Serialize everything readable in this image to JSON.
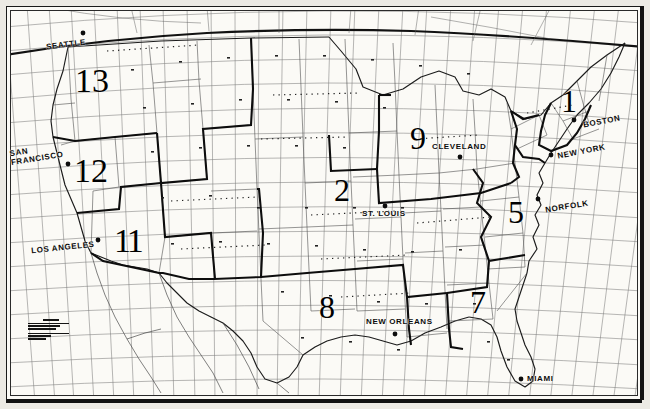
{
  "map": {
    "title": "United States zone map",
    "description": "Scanned black-and-white map of the continental United States showing a latitude/longitude graticule, state outlines and heavy numbered zone boundaries.",
    "colors": {
      "ink": "#111111",
      "paper": "#fbfaf6",
      "page": "#eceae4",
      "grid": "#6e6e6e",
      "state_line": "#4a4a4a",
      "zone_line": "#0d0d0d"
    },
    "grid": {
      "visible": true,
      "style": "graticule",
      "meridian_count": 30,
      "parallel_count": 18
    },
    "cities": [
      {
        "name": "SEATTLE",
        "x": 46,
        "y": 43,
        "dot_x": 83,
        "dot_y": 33,
        "lines": [
          "SEATTLE"
        ]
      },
      {
        "name": "SAN FRANCISCO",
        "x": 10,
        "y": 148,
        "dot_x": 68,
        "dot_y": 164,
        "lines": [
          "SAN",
          "FRANCISCO"
        ]
      },
      {
        "name": "LOS ANGELES",
        "x": 33,
        "y": 248,
        "dot_x": 98,
        "dot_y": 240,
        "lines": [
          "LOS ANGELES"
        ]
      },
      {
        "name": "ST. LOUIS",
        "x": 362,
        "y": 213,
        "dot_x": 385,
        "dot_y": 206,
        "lines": [
          "ST. LOUIS"
        ]
      },
      {
        "name": "NEW ORLEANS",
        "x": 368,
        "y": 321,
        "dot_x": 395,
        "dot_y": 334,
        "lines": [
          "NEW ORLEANS"
        ]
      },
      {
        "name": "MIAMI",
        "x": 529,
        "y": 377,
        "dot_x": 521,
        "dot_y": 379,
        "lines": [
          "MIAMI"
        ]
      },
      {
        "name": "NORFOLK",
        "x": 547,
        "y": 206,
        "dot_x": 538,
        "dot_y": 199,
        "lines": [
          "NORFOLK"
        ]
      },
      {
        "name": "CLEVELAND",
        "x": 434,
        "y": 146,
        "dot_x": 460,
        "dot_y": 157,
        "lines": [
          "CLEVELAND"
        ]
      },
      {
        "name": "BOSTON",
        "x": 585,
        "y": 120,
        "dot_x": 574,
        "dot_y": 120,
        "lines": [
          "BOSTON"
        ]
      },
      {
        "name": "NEW YORK",
        "x": 559,
        "y": 150,
        "dot_x": 551,
        "dot_y": 155,
        "lines": [
          "NEW YORK"
        ]
      }
    ],
    "zones": [
      {
        "label": "13",
        "x": 75,
        "y": 68,
        "size": 34
      },
      {
        "label": "12",
        "x": 74,
        "y": 158,
        "size": 34
      },
      {
        "label": "11",
        "x": 117,
        "y": 228,
        "size": 34
      },
      {
        "label": "9",
        "x": 410,
        "y": 125,
        "size": 32
      },
      {
        "label": "2",
        "x": 334,
        "y": 178,
        "size": 32
      },
      {
        "label": "5",
        "x": 508,
        "y": 200,
        "size": 32
      },
      {
        "label": "7",
        "x": 470,
        "y": 290,
        "size": 32
      },
      {
        "label": "8",
        "x": 319,
        "y": 295,
        "size": 32
      },
      {
        "label": "1",
        "x": 559,
        "y": 88,
        "size": 32
      }
    ],
    "credit": {
      "visible": true,
      "legible": false,
      "note": "Small illegible printed publisher / copyright block"
    }
  }
}
